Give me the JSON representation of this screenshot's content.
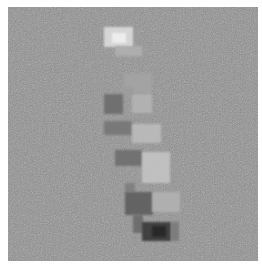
{
  "image": {
    "description": "Noisy grayscale pixelated image showing a vertical stroke of light and dark square blocks, resembling a digit '1' attribution map",
    "background_color": "#8f8f8f",
    "border_color": "#ffffff",
    "canvas": {
      "x": 8,
      "y": 7,
      "width": 250,
      "height": 254
    },
    "blocks": [
      {
        "x": 96,
        "y": 20,
        "w": 29,
        "h": 20,
        "color": "#dcdcdc"
      },
      {
        "x": 104,
        "y": 26,
        "w": 14,
        "h": 10,
        "color": "#f0f0f0"
      },
      {
        "x": 107,
        "y": 39,
        "w": 27,
        "h": 10,
        "color": "#b0b0b0"
      },
      {
        "x": 116,
        "y": 66,
        "w": 28,
        "h": 20,
        "color": "#a4a4a4"
      },
      {
        "x": 96,
        "y": 87,
        "w": 19,
        "h": 20,
        "color": "#6c6c6c"
      },
      {
        "x": 124,
        "y": 87,
        "w": 20,
        "h": 19,
        "color": "#b4b4b4"
      },
      {
        "x": 115,
        "y": 80,
        "w": 10,
        "h": 8,
        "color": "#9c9c9c"
      },
      {
        "x": 96,
        "y": 114,
        "w": 28,
        "h": 14,
        "color": "#767676"
      },
      {
        "x": 124,
        "y": 117,
        "w": 29,
        "h": 19,
        "color": "#bcbcbc"
      },
      {
        "x": 107,
        "y": 143,
        "w": 27,
        "h": 16,
        "color": "#6e6e6e"
      },
      {
        "x": 134,
        "y": 145,
        "w": 28,
        "h": 31,
        "color": "#c4c4c4"
      },
      {
        "x": 117,
        "y": 176,
        "w": 10,
        "h": 9,
        "color": "#7e7e7e"
      },
      {
        "x": 117,
        "y": 185,
        "w": 28,
        "h": 23,
        "color": "#5e5e5e"
      },
      {
        "x": 144,
        "y": 185,
        "w": 28,
        "h": 20,
        "color": "#b2b2b2"
      },
      {
        "x": 125,
        "y": 208,
        "w": 10,
        "h": 18,
        "color": "#6a6a6a"
      },
      {
        "x": 134,
        "y": 215,
        "w": 29,
        "h": 19,
        "color": "#383838"
      },
      {
        "x": 144,
        "y": 219,
        "w": 14,
        "h": 11,
        "color": "#262626"
      },
      {
        "x": 163,
        "y": 215,
        "w": 8,
        "h": 19,
        "color": "#7a7a7a"
      }
    ]
  }
}
